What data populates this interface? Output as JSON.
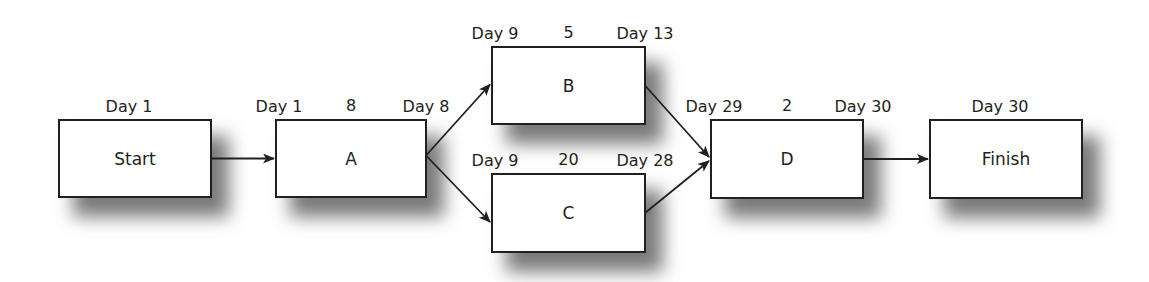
{
  "diagram": {
    "type": "activity-on-node network (critical path)",
    "nodes": [
      {
        "id": "start",
        "label": "Start",
        "start": "Day 1"
      },
      {
        "id": "a",
        "label": "A",
        "start": "Day 1",
        "duration": "8",
        "end": "Day 8"
      },
      {
        "id": "b",
        "label": "B",
        "start": "Day 9",
        "duration": "5",
        "end": "Day 13"
      },
      {
        "id": "c",
        "label": "C",
        "start": "Day 9",
        "duration": "20",
        "end": "Day 28"
      },
      {
        "id": "d",
        "label": "D",
        "start": "Day 29",
        "duration": "2",
        "end": "Day 30"
      },
      {
        "id": "finish",
        "label": "Finish",
        "start": "Day 30"
      }
    ],
    "edges": [
      {
        "from": "start",
        "to": "a"
      },
      {
        "from": "a",
        "to": "b"
      },
      {
        "from": "a",
        "to": "c"
      },
      {
        "from": "b",
        "to": "d"
      },
      {
        "from": "c",
        "to": "d"
      },
      {
        "from": "d",
        "to": "finish"
      }
    ]
  }
}
